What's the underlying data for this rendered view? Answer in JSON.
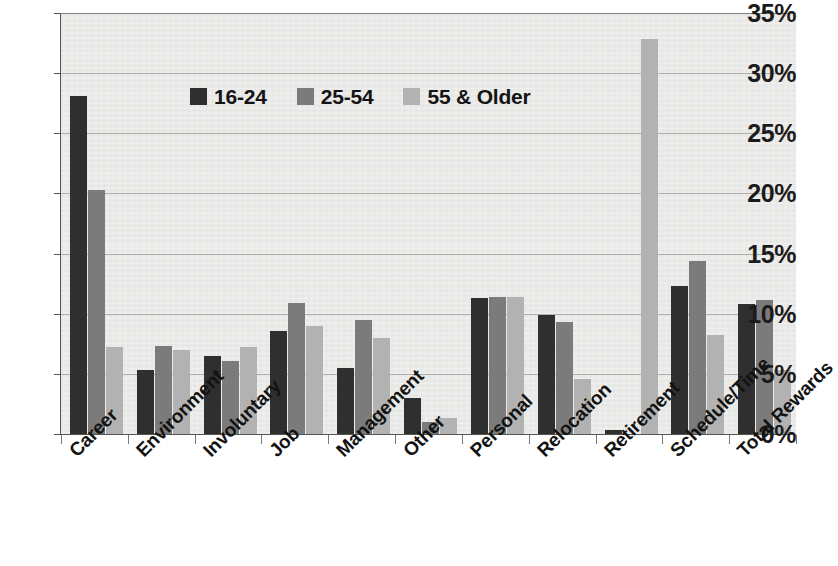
{
  "chart_data": {
    "type": "bar",
    "title": "",
    "subtitle": "",
    "xlabel": "",
    "ylabel": "",
    "ylim": [
      0,
      35
    ],
    "y_ticks": [
      "0%",
      "5%",
      "10%",
      "15%",
      "20%",
      "25%",
      "30%",
      "35%"
    ],
    "y_tick_values": [
      0,
      5,
      10,
      15,
      20,
      25,
      30,
      35
    ],
    "grid": true,
    "legend_position": "top-center",
    "value_unit": "%",
    "categories": [
      "Career",
      "Environment",
      "Involuntary",
      "Job",
      "Management",
      "Other",
      "Personal",
      "Relocation",
      "Retirement",
      "Schedule/Time",
      "Total Rewards"
    ],
    "series": [
      {
        "name": "16-24",
        "color": "#2f2f2f",
        "values": [
          28.1,
          5.3,
          6.5,
          8.6,
          5.5,
          3.0,
          11.3,
          9.9,
          0.3,
          12.3,
          10.8
        ]
      },
      {
        "name": "25-54",
        "color": "#7b7b7b",
        "values": [
          20.3,
          7.3,
          6.1,
          10.9,
          9.5,
          1.0,
          11.4,
          9.3,
          0.0,
          14.4,
          11.1
        ]
      },
      {
        "name": "55 & Older",
        "color": "#b2b2b2",
        "values": [
          7.2,
          7.0,
          7.2,
          9.0,
          8.0,
          1.3,
          11.4,
          4.6,
          32.8,
          8.2,
          5.3
        ]
      }
    ]
  },
  "legend": {
    "items": [
      {
        "label": "16-24"
      },
      {
        "label": "25-54"
      },
      {
        "label": "55 & Older"
      }
    ]
  },
  "background_bleed": {
    "line1": "",
    "line2": "",
    "line3": "",
    "line4": ""
  }
}
